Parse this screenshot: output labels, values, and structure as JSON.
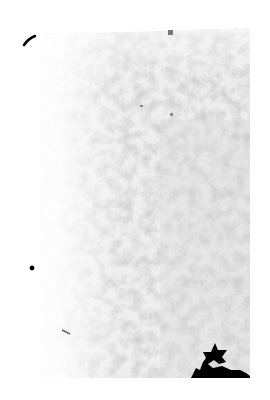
{
  "image": {
    "description": "Grainy grayscale speckled texture fading to white on the left and top",
    "background": "#ffffff",
    "texture_tones": [
      "#f4f4f4",
      "#e6e6e6",
      "#d6d6d6",
      "#c4c4c4",
      "#a8a8a8"
    ],
    "ink_color": "#000000"
  }
}
